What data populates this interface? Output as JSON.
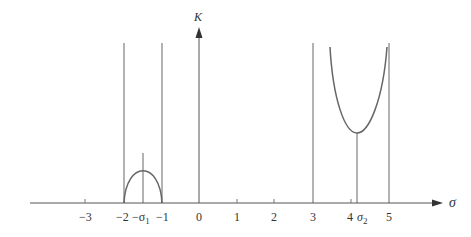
{
  "diagram": {
    "type": "root-locus-sketch",
    "axes": {
      "x_label": "σ",
      "y_label": "K",
      "x_ticks": [
        {
          "value": -3,
          "label": "−3"
        },
        {
          "value": -2,
          "label": "−2"
        },
        {
          "value": -1,
          "label": "−1"
        },
        {
          "value": 0,
          "label": "0"
        },
        {
          "value": 1,
          "label": "1"
        },
        {
          "value": 2,
          "label": "2"
        },
        {
          "value": 3,
          "label": "3"
        },
        {
          "value": 4,
          "label": "4"
        },
        {
          "value": 5,
          "label": "5"
        }
      ]
    },
    "special_points": {
      "sigma1": {
        "label_prefix": "−σ",
        "subscript": "1",
        "value": -1.5
      },
      "sigma2": {
        "label": "σ",
        "subscript": "2",
        "value": 4.15
      }
    },
    "asymptotes": [
      -2,
      -1,
      3,
      5
    ],
    "curves": [
      {
        "name": "breakaway-arc",
        "from": -2,
        "to": -1,
        "peak_at": -1.5
      },
      {
        "name": "break-in-parabola",
        "from": 3.5,
        "to": 4.95,
        "min_at": 4.15
      }
    ],
    "colors": {
      "line": "#555555",
      "curve": "#666666",
      "text": "#333333"
    }
  }
}
